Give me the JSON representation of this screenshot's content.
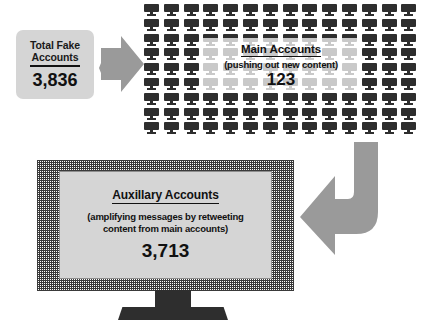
{
  "diagram": {
    "total_box": {
      "title_line1": "Total Fake",
      "title_line2": "Accounts",
      "value": "3,836"
    },
    "arrow_right": {
      "icon": "arrow-right-icon"
    },
    "main_accounts": {
      "title": "Main Accounts",
      "subtitle": "(pushing out new content)",
      "value": "123",
      "icon_grid": {
        "icon": "monitor-icon",
        "columns": 14,
        "rows": 9
      }
    },
    "arrow_curve": {
      "icon": "arrow-curve-down-left-icon"
    },
    "auxillary_accounts": {
      "title": "Auxillary Accounts",
      "subtitle_line1": "(amplifying messages by retweeting",
      "subtitle_line2": "content from main accounts)",
      "value": "3,713"
    }
  },
  "colors": {
    "box_fill": "#d5d5d5",
    "arrow_fill": "#9a9a9a",
    "icon_dark": "#2e2e2e",
    "text": "#111111",
    "background": "#ffffff"
  }
}
